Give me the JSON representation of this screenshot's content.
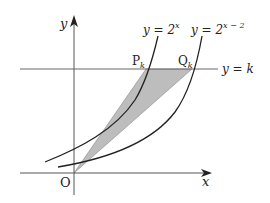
{
  "diagram": {
    "axes": {
      "x_label": "x",
      "y_label": "y",
      "origin_label": "O"
    },
    "curves": [
      {
        "label_prefix": "y = 2",
        "exponent": "x"
      },
      {
        "label_prefix": "y = 2",
        "exponent": "x − 2"
      }
    ],
    "horizontal_line": {
      "label": "y = k"
    },
    "points": [
      {
        "name": "P",
        "subscript": "k"
      },
      {
        "name": "Q",
        "subscript": "k"
      }
    ],
    "colors": {
      "stroke": "#222222",
      "shade": "#b8b8b8",
      "axis": "#555555"
    }
  }
}
